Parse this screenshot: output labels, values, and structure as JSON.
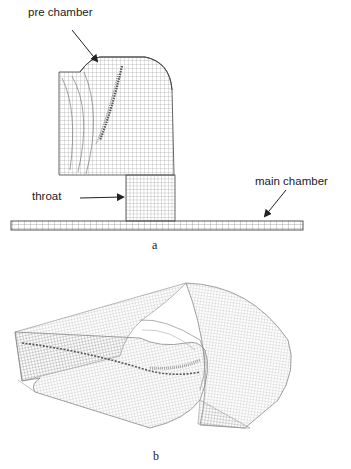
{
  "figure_a": {
    "caption": "a",
    "labels": {
      "pre_chamber": "pre chamber",
      "throat": "throat",
      "main_chamber": "main chamber"
    }
  },
  "figure_b": {
    "caption": "b"
  },
  "colors": {
    "mesh_line": "#8a8a8a",
    "mesh_dark": "#555555",
    "text": "#222222",
    "arrow": "#222222"
  }
}
